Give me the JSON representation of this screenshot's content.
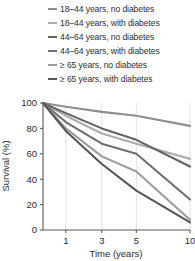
{
  "legend": {
    "position": "top",
    "entries": [
      {
        "label": "18–44 years, no diabetes",
        "color": "#8e8e8e"
      },
      {
        "label": "18–44 years, with diabetes",
        "color": "#adadad"
      },
      {
        "label": "44–64 years, no diabetes",
        "color": "#636363"
      },
      {
        "label": "44–64 years, with diabetes",
        "color": "#6e6e6e"
      },
      {
        "label": "≥ 65 years, no diabetes",
        "color": "#9c9c9c"
      },
      {
        "label": "≥ 65 years, with diabetes",
        "color": "#565656"
      }
    ]
  },
  "axes": {
    "xlabel": "Time (years)",
    "ylabel": "Survival (%)",
    "xticks": [
      "1",
      "3",
      "5",
      "10"
    ],
    "yticks": [
      "0",
      "20",
      "40",
      "60",
      "80",
      "100"
    ]
  },
  "chart_data": {
    "type": "line",
    "title": "",
    "xlabel": "Time (years)",
    "ylabel": "Survival (%)",
    "x": [
      0,
      1,
      3,
      5,
      10
    ],
    "xtick_values": [
      1,
      3,
      5,
      10
    ],
    "xtick_labels": [
      "1",
      "3",
      "5",
      "10"
    ],
    "xscale": "categorical-nonlinear",
    "ylim": [
      0,
      100
    ],
    "ytick_values": [
      0,
      20,
      40,
      60,
      80,
      100
    ],
    "grid": "vertical-only",
    "legend_position": "top",
    "series": [
      {
        "name": "18–44 years, no diabetes",
        "color": "#8e8e8e",
        "values": [
          100,
          97,
          93,
          90,
          82
        ]
      },
      {
        "name": "18–44 years, with diabetes",
        "color": "#adadad",
        "values": [
          100,
          90,
          76,
          68,
          56
        ]
      },
      {
        "name": "44–64 years, no diabetes",
        "color": "#636363",
        "values": [
          100,
          92,
          80,
          71,
          50
        ]
      },
      {
        "name": "44–64 years, with diabetes",
        "color": "#6e6e6e",
        "values": [
          100,
          85,
          68,
          60,
          24
        ]
      },
      {
        "name": "≥ 65 years, no diabetes",
        "color": "#9c9c9c",
        "values": [
          100,
          80,
          58,
          46,
          8
        ]
      },
      {
        "name": "≥ 65 years, with diabetes",
        "color": "#565656",
        "values": [
          100,
          78,
          52,
          31,
          6
        ]
      }
    ]
  }
}
